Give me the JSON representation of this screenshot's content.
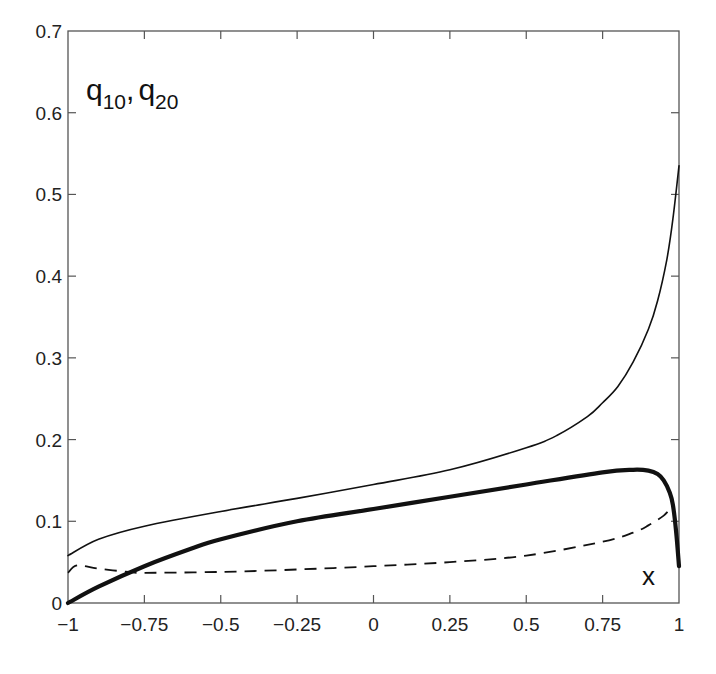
{
  "chart_data": {
    "type": "line",
    "title": "",
    "xlabel": "x",
    "ylabel": "q10, q20",
    "ylabel_parts": {
      "q1": "q",
      "sub1": "10",
      "sep": ",",
      "q2": "q",
      "sub2": "20"
    },
    "xlim": [
      -1,
      1
    ],
    "ylim": [
      0,
      0.7
    ],
    "grid": false,
    "legend": "none",
    "x_ticks": [
      -1,
      -0.75,
      -0.5,
      -0.25,
      0,
      0.25,
      0.5,
      0.75,
      1
    ],
    "x_tick_labels": [
      "−1",
      "−0.75",
      "−0.5",
      "−0.25",
      "0",
      "0.25",
      "0.5",
      "0.75",
      "1"
    ],
    "y_ticks": [
      0,
      0.1,
      0.2,
      0.3,
      0.4,
      0.5,
      0.6,
      0.7
    ],
    "y_tick_labels": [
      "0",
      "0.1",
      "0.2",
      "0.3",
      "0.4",
      "0.5",
      "0.6",
      "0.7"
    ],
    "series": [
      {
        "name": "thin solid",
        "style": "solid",
        "width": 1.6,
        "x": [
          -1,
          -0.9,
          -0.75,
          -0.5,
          -0.25,
          0,
          0.25,
          0.5,
          0.6,
          0.7,
          0.75,
          0.8,
          0.85,
          0.9,
          0.93,
          0.96,
          0.98,
          1
        ],
        "y": [
          0.058,
          0.078,
          0.094,
          0.112,
          0.128,
          0.145,
          0.163,
          0.19,
          0.205,
          0.228,
          0.245,
          0.265,
          0.295,
          0.335,
          0.37,
          0.42,
          0.47,
          0.535
        ]
      },
      {
        "name": "thick solid",
        "style": "solid",
        "width": 4.2,
        "x": [
          -1,
          -0.9,
          -0.75,
          -0.6,
          -0.5,
          -0.25,
          0,
          0.25,
          0.5,
          0.75,
          0.85,
          0.9,
          0.93,
          0.95,
          0.97,
          0.98,
          0.99,
          1
        ],
        "y": [
          0,
          0.02,
          0.045,
          0.066,
          0.078,
          0.1,
          0.115,
          0.13,
          0.145,
          0.16,
          0.163,
          0.162,
          0.158,
          0.15,
          0.135,
          0.12,
          0.09,
          0.045
        ]
      },
      {
        "name": "dashed",
        "style": "dashed",
        "width": 1.8,
        "x": [
          -1,
          -0.97,
          -0.9,
          -0.8,
          -0.75,
          -0.5,
          -0.25,
          0,
          0.25,
          0.5,
          0.75,
          0.85,
          0.9,
          0.95,
          0.97
        ],
        "y": [
          0.037,
          0.046,
          0.042,
          0.038,
          0.037,
          0.038,
          0.041,
          0.045,
          0.05,
          0.058,
          0.075,
          0.086,
          0.095,
          0.107,
          0.115
        ]
      }
    ]
  },
  "colors": {
    "background": "#ffffff",
    "axis": "#555555",
    "line": "#111111"
  }
}
